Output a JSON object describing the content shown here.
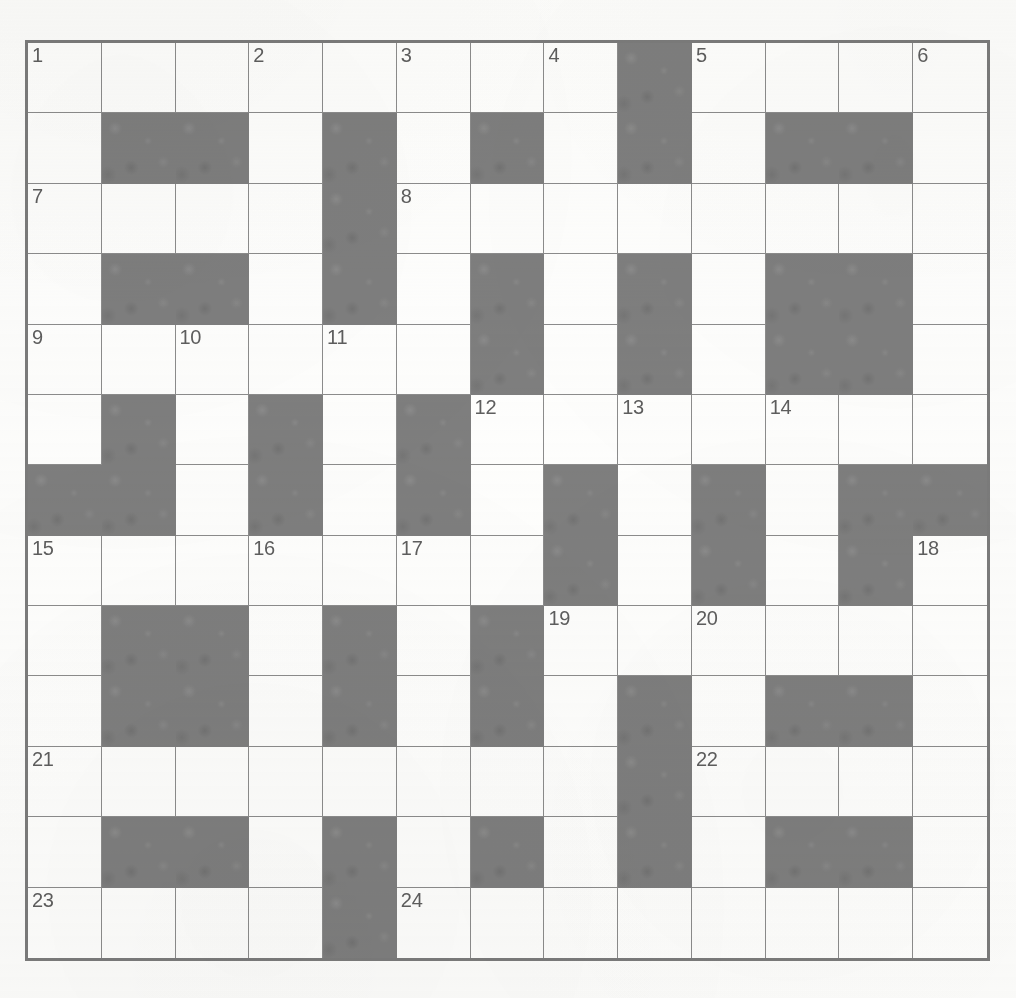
{
  "puzzle": {
    "type": "crossword-grid",
    "title": "Crossword Puzzle Grid",
    "rows": 13,
    "cols": 13,
    "colors": {
      "blocked_cell": "#7e7e7e",
      "open_cell": "#fefefd",
      "grid_line": "#8c8c8c",
      "outer_border": "#7b7b7b",
      "clue_number_text": "#5e5e5e",
      "page_background": "#fdfdfc"
    },
    "legend": {
      "open_symbol": ".",
      "blocked_symbol": "#"
    },
    "grid": [
      "........#....",
      ".##.#.#.#.##.",
      "....#........",
      ".##.#.#.#.##.",
      "......#.#.##.",
      ".#.#.#.......",
      "##.#.#.#.#.##",
      ".......#.#.#.",
      ".##.#.#......",
      ".##.#.#.#.##.",
      "........#....",
      ".##.#.#.#.##.",
      "....#........"
    ],
    "numbers": [
      {
        "n": "1",
        "row": 1,
        "col": 1
      },
      {
        "n": "2",
        "row": 1,
        "col": 4
      },
      {
        "n": "3",
        "row": 1,
        "col": 6
      },
      {
        "n": "4",
        "row": 1,
        "col": 8
      },
      {
        "n": "5",
        "row": 1,
        "col": 10
      },
      {
        "n": "6",
        "row": 1,
        "col": 13
      },
      {
        "n": "7",
        "row": 3,
        "col": 1
      },
      {
        "n": "8",
        "row": 3,
        "col": 6
      },
      {
        "n": "9",
        "row": 5,
        "col": 1
      },
      {
        "n": "10",
        "row": 5,
        "col": 3
      },
      {
        "n": "11",
        "row": 5,
        "col": 5
      },
      {
        "n": "12",
        "row": 6,
        "col": 7
      },
      {
        "n": "13",
        "row": 6,
        "col": 9
      },
      {
        "n": "14",
        "row": 6,
        "col": 11
      },
      {
        "n": "15",
        "row": 8,
        "col": 1
      },
      {
        "n": "16",
        "row": 8,
        "col": 4
      },
      {
        "n": "17",
        "row": 8,
        "col": 6
      },
      {
        "n": "18",
        "row": 8,
        "col": 13
      },
      {
        "n": "19",
        "row": 9,
        "col": 8
      },
      {
        "n": "20",
        "row": 9,
        "col": 10
      },
      {
        "n": "21",
        "row": 11,
        "col": 1
      },
      {
        "n": "22",
        "row": 11,
        "col": 10
      },
      {
        "n": "23",
        "row": 13,
        "col": 1
      },
      {
        "n": "24",
        "row": 13,
        "col": 6
      }
    ],
    "entered_letters": []
  }
}
